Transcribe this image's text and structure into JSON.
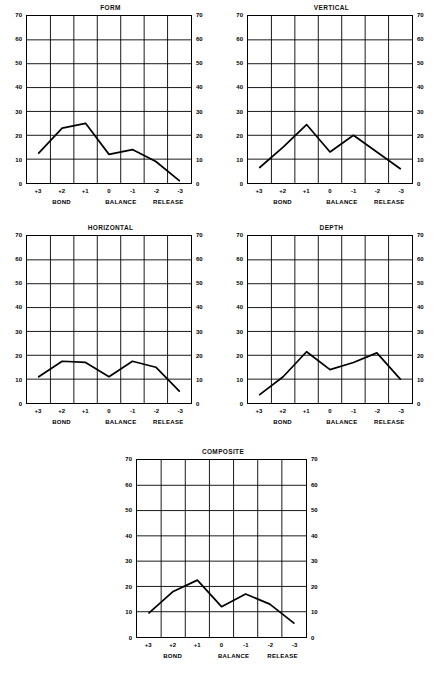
{
  "figure": {
    "panel_layout": "2x2-plus-centered-bottom",
    "axis": {
      "y_ticks": [
        0,
        10,
        20,
        30,
        40,
        50,
        60,
        70
      ],
      "y_min": 0,
      "y_max": 70,
      "x_ticks": [
        "+3",
        "+2",
        "+1",
        "0",
        "-1",
        "-2",
        "-3"
      ],
      "x_groups": [
        "BOND",
        "BALANCE",
        "RELEASE"
      ],
      "line_color": "#000000",
      "grid_color": "#000000",
      "background": "#ffffff"
    }
  },
  "chart_data": [
    {
      "type": "line",
      "title": "FORM",
      "categories": [
        "+3",
        "+2",
        "+1",
        "0",
        "-1",
        "-2",
        "-3"
      ],
      "values": [
        12.5,
        23,
        25,
        12,
        14,
        9,
        1
      ],
      "xlabel": "",
      "ylabel": "",
      "ylim": [
        0,
        70
      ],
      "grid": true,
      "legend": "none"
    },
    {
      "type": "line",
      "title": "VERTICAL",
      "categories": [
        "+3",
        "+2",
        "+1",
        "0",
        "-1",
        "-2",
        "-3"
      ],
      "values": [
        6.5,
        15,
        24.5,
        13,
        20,
        13,
        6
      ],
      "xlabel": "",
      "ylabel": "",
      "ylim": [
        0,
        70
      ],
      "grid": true,
      "legend": "none"
    },
    {
      "type": "line",
      "title": "HORIZONTAL",
      "categories": [
        "+3",
        "+2",
        "+1",
        "0",
        "-1",
        "-2",
        "-3"
      ],
      "values": [
        11,
        17.5,
        17,
        11,
        17.5,
        15,
        5
      ],
      "xlabel": "",
      "ylabel": "",
      "ylim": [
        0,
        70
      ],
      "grid": true,
      "legend": "none"
    },
    {
      "type": "line",
      "title": "DEPTH",
      "categories": [
        "+3",
        "+2",
        "+1",
        "0",
        "-1",
        "-2",
        "-3"
      ],
      "values": [
        3.5,
        11,
        21.5,
        14,
        17,
        21,
        10
      ],
      "xlabel": "",
      "ylabel": "",
      "ylim": [
        0,
        70
      ],
      "grid": true,
      "legend": "none"
    },
    {
      "type": "line",
      "title": "COMPOSITE",
      "categories": [
        "+3",
        "+2",
        "+1",
        "0",
        "-1",
        "-2",
        "-3"
      ],
      "values": [
        9.5,
        18,
        22.5,
        12,
        17,
        13,
        5.5
      ],
      "xlabel": "",
      "ylabel": "",
      "ylim": [
        0,
        70
      ],
      "grid": true,
      "legend": "none"
    }
  ]
}
